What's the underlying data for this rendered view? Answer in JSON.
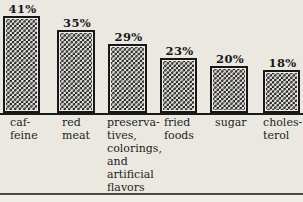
{
  "chart_data": {
    "type": "bar",
    "title": "",
    "xlabel": "",
    "ylabel": "",
    "grid": false,
    "legend": false,
    "ylim": [
      0,
      45
    ],
    "unit": "%",
    "categories": [
      "caffeine",
      "red meat",
      "preservatives, colorings, and artificial flavors",
      "fried foods",
      "sugar",
      "cholesterol"
    ],
    "values": [
      41,
      35,
      29,
      23,
      20,
      18
    ],
    "value_labels": [
      "41%",
      "35%",
      "29%",
      "23%",
      "20%",
      "18%"
    ],
    "category_labels_wrapped": [
      "caf-\nfeine",
      "red\nmeat",
      "preserva-\ntives,\ncolorings,\nand\nartificial\nflavors",
      "fried\nfoods",
      "sugar",
      "choles-\nterol"
    ],
    "bar_fill": "black-white-checkerboard",
    "colors": {
      "bar_ink": "#171717",
      "checker_light": "#e3e1dc",
      "paper": "#ebe8e2",
      "text": "#1e1c1a",
      "axis_line": "#1a1a1a",
      "bottom_rule": "#4a4845"
    }
  }
}
